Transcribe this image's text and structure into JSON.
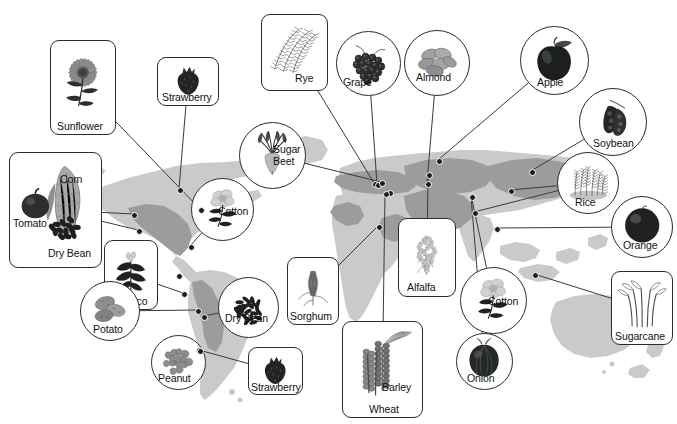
{
  "figure": {
    "kind": "world-map-diagram",
    "title_text_visible": false,
    "background_color": "#ffffff",
    "map_land_color": "#c9cbcb",
    "map_region_color": "#9b9d9d",
    "map_outline_color": "#ffffff",
    "callout_border_color": "#2b2b2b",
    "leader_line_color": "#3a3a3a",
    "node_dot_color": "#1d1d1d",
    "label_text_color": "#111111"
  },
  "callouts": [
    {
      "id": "sunflower",
      "label": "Sunflower",
      "shape": "box",
      "icon": "sunflower-icon",
      "x": 50,
      "y": 40,
      "w": 66,
      "h": 95,
      "label_x": 6,
      "label_y": 80,
      "wrap": false
    },
    {
      "id": "strawberry-na",
      "label": "Strawberry",
      "shape": "box",
      "icon": "strawberry-icon",
      "x": 157,
      "y": 57,
      "w": 62,
      "h": 49,
      "label_x": 4,
      "label_y": 34,
      "wrap": false
    },
    {
      "id": "rye",
      "label": "Rye",
      "shape": "box",
      "icon": "rye-icon",
      "x": 261,
      "y": 14,
      "w": 67,
      "h": 77,
      "label_x": 33,
      "label_y": 58,
      "wrap": false
    },
    {
      "id": "grape",
      "label": "Grape",
      "shape": "circle",
      "icon": "grape-icon",
      "x": 336,
      "y": 31,
      "w": 65,
      "h": 65,
      "label_x": 6,
      "label_y": 45,
      "wrap": false
    },
    {
      "id": "almond",
      "label": "Almond",
      "shape": "circle",
      "icon": "almond-icon",
      "x": 404,
      "y": 30,
      "w": 66,
      "h": 66,
      "label_x": 11,
      "label_y": 41,
      "wrap": false
    },
    {
      "id": "apple",
      "label": "Apple",
      "shape": "circle",
      "icon": "apple-icon",
      "x": 520,
      "y": 26,
      "w": 69,
      "h": 69,
      "label_x": 16,
      "label_y": 50,
      "wrap": false
    },
    {
      "id": "soybean",
      "label": "Soybean",
      "shape": "circle",
      "icon": "soybean-icon",
      "x": 579,
      "y": 88,
      "w": 68,
      "h": 68,
      "label_x": 13,
      "label_y": 49,
      "wrap": false
    },
    {
      "id": "sugar-beet",
      "label": "Sugar Beet",
      "shape": "circle",
      "icon": "sugarbeet-icon",
      "x": 239,
      "y": 122,
      "w": 67,
      "h": 67,
      "label_x": 33,
      "label_y": 21,
      "wrap": true
    },
    {
      "id": "corn-group",
      "label": "Corn",
      "shape": "box",
      "icon": "corn-group-icon",
      "x": 9,
      "y": 152,
      "w": 93,
      "h": 116,
      "label_x": 50,
      "label_y": 21,
      "wrap": false,
      "extra_labels": [
        {
          "text": "Tomato",
          "x": 3,
          "y": 65
        },
        {
          "text": "Dry Bean",
          "x": 38,
          "y": 95
        }
      ]
    },
    {
      "id": "cotton-am",
      "label": "Cotton",
      "shape": "circle",
      "icon": "cotton-icon",
      "x": 191,
      "y": 178,
      "w": 63,
      "h": 63,
      "label_x": 26,
      "label_y": 27,
      "wrap": false
    },
    {
      "id": "rice",
      "label": "Rice",
      "shape": "circle",
      "icon": "rice-icon",
      "x": 557,
      "y": 152,
      "w": 62,
      "h": 62,
      "label_x": 17,
      "label_y": 44,
      "wrap": false
    },
    {
      "id": "orange",
      "label": "Orange",
      "shape": "circle",
      "icon": "orange-icon",
      "x": 611,
      "y": 196,
      "w": 62,
      "h": 62,
      "label_x": 11,
      "label_y": 43,
      "wrap": false
    },
    {
      "id": "alfalfa",
      "label": "Alfalfa",
      "shape": "box",
      "icon": "alfalfa-icon",
      "x": 398,
      "y": 218,
      "w": 58,
      "h": 79,
      "label_x": 8,
      "label_y": 63,
      "wrap": false
    },
    {
      "id": "tobacco",
      "label": "Tobacco",
      "shape": "box",
      "icon": "tobacco-icon",
      "x": 104,
      "y": 240,
      "w": 54,
      "h": 70,
      "label_x": 4,
      "label_y": 55,
      "wrap": false
    },
    {
      "id": "dry-bean-sa",
      "label": "Dry Bean",
      "shape": "circle",
      "icon": "drybean-icon",
      "x": 218,
      "y": 277,
      "w": 61,
      "h": 61,
      "label_x": 6,
      "label_y": 35,
      "wrap": false
    },
    {
      "id": "sorghum",
      "label": "Sorghum",
      "shape": "box",
      "icon": "sorghum-icon",
      "x": 287,
      "y": 257,
      "w": 52,
      "h": 68,
      "label_x": 2,
      "label_y": 53,
      "wrap": false
    },
    {
      "id": "cotton-asia",
      "label": "Cotton",
      "shape": "circle",
      "icon": "cotton-icon",
      "x": 460,
      "y": 267,
      "w": 67,
      "h": 67,
      "label_x": 27,
      "label_y": 28,
      "wrap": false
    },
    {
      "id": "sugarcane",
      "label": "Sugarcane",
      "shape": "box",
      "icon": "sugarcane-icon",
      "x": 611,
      "y": 271,
      "w": 62,
      "h": 74,
      "label_x": 3,
      "label_y": 59,
      "wrap": false
    },
    {
      "id": "potato",
      "label": "Potato",
      "shape": "circle",
      "icon": "potato-icon",
      "x": 80,
      "y": 281,
      "w": 60,
      "h": 60,
      "label_x": 12,
      "label_y": 42,
      "wrap": false
    },
    {
      "id": "peanut",
      "label": "Peanut",
      "shape": "circle",
      "icon": "peanut-icon",
      "x": 151,
      "y": 335,
      "w": 55,
      "h": 55,
      "label_x": 6,
      "label_y": 37,
      "wrap": false
    },
    {
      "id": "strawberry-sa",
      "label": "Strawberry",
      "shape": "box",
      "icon": "strawberry-icon",
      "x": 248,
      "y": 347,
      "w": 55,
      "h": 48,
      "label_x": 2,
      "label_y": 34,
      "wrap": false
    },
    {
      "id": "onion",
      "label": "Onion",
      "shape": "circle",
      "icon": "onion-icon",
      "x": 456,
      "y": 333,
      "w": 57,
      "h": 57,
      "label_x": 10,
      "label_y": 39,
      "wrap": false
    },
    {
      "id": "wheat-barley",
      "label": "Barley",
      "shape": "box",
      "icon": "wheat-icon",
      "x": 342,
      "y": 321,
      "w": 81,
      "h": 97,
      "label_x": 39,
      "label_y": 60,
      "wrap": false,
      "extra_labels": [
        {
          "text": "Wheat",
          "x": 26,
          "y": 82
        }
      ]
    }
  ],
  "map_nodes": [
    {
      "id": "n-sunflower",
      "x": 200,
      "y": 209
    },
    {
      "id": "n-strawberry-na",
      "x": 179,
      "y": 189
    },
    {
      "id": "n-corn-a",
      "x": 133,
      "y": 214
    },
    {
      "id": "n-corn-b",
      "x": 138,
      "y": 230
    },
    {
      "id": "n-cotton-am",
      "x": 190,
      "y": 246
    },
    {
      "id": "n-tobacco-a",
      "x": 178,
      "y": 275
    },
    {
      "id": "n-tobacco-b",
      "x": 183,
      "y": 293
    },
    {
      "id": "n-potato-a",
      "x": 197,
      "y": 310
    },
    {
      "id": "n-drybean-sa",
      "x": 203,
      "y": 316
    },
    {
      "id": "n-peanut",
      "x": 198,
      "y": 349
    },
    {
      "id": "n-strawberry-sa",
      "x": 199,
      "y": 350
    },
    {
      "id": "n-rye",
      "x": 374,
      "y": 183
    },
    {
      "id": "n-grape",
      "x": 377,
      "y": 184
    },
    {
      "id": "n-sugarbeet",
      "x": 381,
      "y": 182
    },
    {
      "id": "n-almond",
      "x": 427,
      "y": 183
    },
    {
      "id": "n-apple",
      "x": 438,
      "y": 160
    },
    {
      "id": "n-sorghum",
      "x": 378,
      "y": 226
    },
    {
      "id": "n-alfalfa",
      "x": 428,
      "y": 174
    },
    {
      "id": "n-wheat",
      "x": 389,
      "y": 192
    },
    {
      "id": "n-soybean",
      "x": 531,
      "y": 171
    },
    {
      "id": "n-rice-a",
      "x": 474,
      "y": 212
    },
    {
      "id": "n-rice-b",
      "x": 510,
      "y": 190
    },
    {
      "id": "n-orange",
      "x": 496,
      "y": 228
    },
    {
      "id": "n-cotton-asia",
      "x": 471,
      "y": 195
    },
    {
      "id": "n-onion",
      "x": 471,
      "y": 196
    },
    {
      "id": "n-sugarcane",
      "x": 534,
      "y": 274
    },
    {
      "id": "n-barley",
      "x": 385,
      "y": 193
    }
  ],
  "leader_lines": [
    {
      "from": "sunflower",
      "to": "n-sunflower"
    },
    {
      "from": "strawberry-na",
      "to": "n-strawberry-na"
    },
    {
      "from": "corn-group",
      "to": "n-corn-a"
    },
    {
      "from": "corn-group",
      "to": "n-corn-b"
    },
    {
      "from": "cotton-am",
      "to": "n-cotton-am"
    },
    {
      "from": "tobacco",
      "to": "n-tobacco-b"
    },
    {
      "from": "potato",
      "to": "n-potato-a"
    },
    {
      "from": "dry-bean-sa",
      "to": "n-drybean-sa"
    },
    {
      "from": "peanut",
      "to": "n-peanut"
    },
    {
      "from": "strawberry-sa",
      "to": "n-strawberry-sa"
    },
    {
      "from": "rye",
      "to": "n-rye"
    },
    {
      "from": "grape",
      "to": "n-grape"
    },
    {
      "from": "sugar-beet",
      "to": "n-sugarbeet"
    },
    {
      "from": "almond",
      "to": "n-almond"
    },
    {
      "from": "apple",
      "to": "n-apple"
    },
    {
      "from": "sorghum",
      "to": "n-sorghum"
    },
    {
      "from": "alfalfa",
      "to": "n-alfalfa"
    },
    {
      "from": "soybean",
      "to": "n-soybean"
    },
    {
      "from": "rice",
      "to": "n-rice-a"
    },
    {
      "from": "rice",
      "to": "n-rice-b"
    },
    {
      "from": "orange",
      "to": "n-orange"
    },
    {
      "from": "cotton-asia",
      "to": "n-cotton-asia"
    },
    {
      "from": "onion",
      "to": "n-onion"
    },
    {
      "from": "sugarcane",
      "to": "n-sugarcane"
    },
    {
      "from": "wheat-barley",
      "to": "n-barley"
    }
  ]
}
